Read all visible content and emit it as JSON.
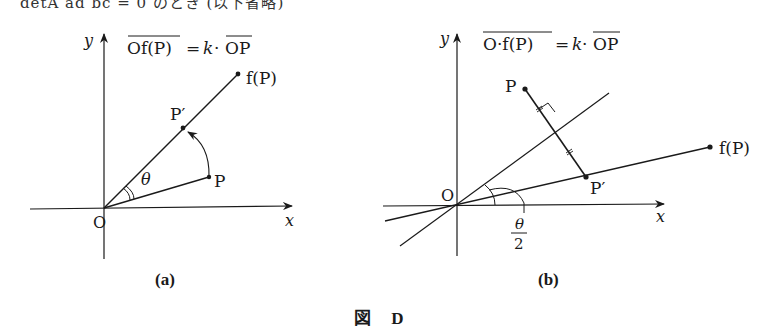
{
  "header_fragment": "detA  ad  bc = 0 のとき (以下省略)",
  "figure": {
    "caption": "図 D",
    "panels": [
      {
        "id": "a",
        "label": "(a)",
        "formula_lhs": "Of(P)",
        "formula_eq": "=",
        "formula_k": "k",
        "formula_dot": "·",
        "formula_rhs": "OP",
        "axis_x": "x",
        "axis_y": "y",
        "origin": "O",
        "points": {
          "P": "P",
          "P_prime": "P′",
          "fP": "f(P)"
        },
        "angle_label": "θ"
      },
      {
        "id": "b",
        "label": "(b)",
        "formula_lhs": "O·f(P)",
        "formula_eq": "=",
        "formula_k": "k",
        "formula_dot": "·",
        "formula_rhs": "OP",
        "axis_x": "x",
        "axis_y": "y",
        "origin": "O",
        "points": {
          "P": "P",
          "P_prime": "P′",
          "fP": "f(P)"
        },
        "angle_label_num": "θ",
        "angle_label_den": "2"
      }
    ]
  }
}
